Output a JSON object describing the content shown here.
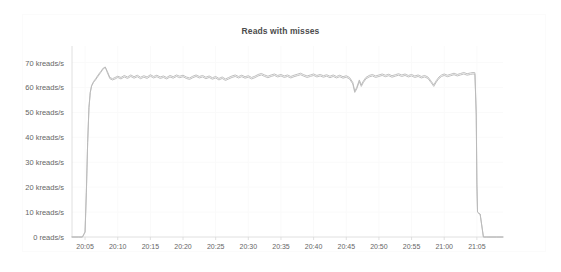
{
  "chart_data": {
    "type": "line",
    "title": "Reads with misses",
    "xlabel": "",
    "ylabel": "",
    "grid": true,
    "legend_position": "none",
    "ylim": [
      0,
      75
    ],
    "xlim": [
      "20:03",
      "21:09"
    ],
    "ytick_labels": [
      "70 kreads/s",
      "60 kreads/s",
      "50 kreads/s",
      "40 kreads/s",
      "30 kreads/s",
      "20 kreads/s",
      "10 kreads/s",
      "0 reads/s"
    ],
    "ytick_values": [
      70,
      60,
      50,
      40,
      30,
      20,
      10,
      0
    ],
    "xtick_labels": [
      "20:05",
      "20:10",
      "20:15",
      "20:20",
      "20:25",
      "20:30",
      "20:35",
      "20:40",
      "20:45",
      "20:50",
      "20:55",
      "21:00",
      "21:05"
    ],
    "xtick_minutes": [
      5,
      10,
      15,
      20,
      25,
      30,
      35,
      40,
      45,
      50,
      55,
      60,
      65
    ],
    "units": "kreads/s",
    "line_color": "#b9b9b9",
    "grid_color": "#fafafa",
    "axis_color": "#d8d8d8",
    "background_color": "#ffffff",
    "x_minutes": [
      3,
      4,
      4.6,
      5,
      5.2,
      5.4,
      5.6,
      5.8,
      6,
      6.3,
      6.6,
      7,
      7.4,
      7.8,
      8.1,
      8.4,
      8.8,
      9.2,
      9.6,
      10,
      10.5,
      11,
      11.5,
      12,
      12.5,
      13,
      13.5,
      14,
      14.5,
      15,
      15.5,
      16,
      16.5,
      17,
      17.5,
      18,
      18.5,
      19,
      19.5,
      20,
      20.5,
      21,
      21.5,
      22,
      22.5,
      23,
      23.5,
      24,
      24.5,
      25,
      25.5,
      26,
      26.5,
      27,
      27.5,
      28,
      28.5,
      29,
      29.5,
      30,
      30.5,
      31,
      31.5,
      32,
      32.5,
      33,
      33.5,
      34,
      34.5,
      35,
      35.5,
      36,
      36.5,
      37,
      37.5,
      38,
      38.5,
      39,
      39.5,
      40,
      40.5,
      41,
      41.5,
      42,
      42.5,
      43,
      43.5,
      44,
      44.5,
      45,
      45.5,
      46,
      46.3,
      46.6,
      47,
      47.3,
      47.6,
      48,
      48.5,
      49,
      49.5,
      50,
      50.5,
      51,
      51.5,
      52,
      52.5,
      53,
      53.5,
      54,
      54.5,
      55,
      55.5,
      56,
      56.5,
      57,
      57.5,
      58,
      58.4,
      58.8,
      59.2,
      59.6,
      60,
      60.5,
      61,
      61.5,
      62,
      62.5,
      63,
      63.5,
      64,
      64.4,
      64.7,
      64.9,
      65,
      65.1,
      65.3,
      65.5,
      66,
      66.5,
      67,
      68,
      69
    ],
    "series": [
      {
        "name": "reads-trace-a",
        "values": [
          0,
          0,
          0,
          2,
          18,
          38,
          52,
          58,
          60.5,
          62,
          63,
          64.5,
          66,
          67.5,
          68,
          66.5,
          64,
          63.5,
          64,
          64.5,
          64,
          64.8,
          64.2,
          65,
          64.3,
          64.9,
          64.1,
          64.7,
          64.2,
          65.1,
          64.4,
          64.9,
          64.2,
          64.6,
          64,
          64.8,
          64.3,
          65,
          64.5,
          64.9,
          64.2,
          63.8,
          64.5,
          65,
          64.4,
          64.8,
          64.1,
          64.6,
          63.9,
          64.4,
          63.6,
          64.2,
          63.4,
          64,
          64.6,
          65,
          64.4,
          64.9,
          64.3,
          64.7,
          64,
          64.5,
          65.2,
          65.6,
          65,
          64.5,
          65,
          65.4,
          64.8,
          65.2,
          64.6,
          65,
          64.4,
          64.9,
          65.3,
          65.7,
          65.1,
          64.6,
          65,
          65.4,
          64.8,
          65.2,
          64.7,
          65.1,
          64.5,
          65,
          64.4,
          64.9,
          64.3,
          64.7,
          64,
          62,
          58.5,
          60,
          63,
          61,
          62.5,
          64,
          64.8,
          65.2,
          64.6,
          65,
          65.4,
          64.9,
          65.3,
          64.7,
          65.1,
          65.5,
          65,
          65.4,
          64.8,
          65.2,
          64.6,
          65,
          64.4,
          64.8,
          64.2,
          62.5,
          61,
          62.8,
          64.2,
          65,
          65.4,
          64.9,
          65.3,
          65.7,
          65.2,
          65.6,
          66,
          65.5,
          65.8,
          66,
          65.9,
          50,
          22,
          10,
          9.5,
          9.2,
          0,
          0,
          0,
          0,
          0,
          0
        ]
      },
      {
        "name": "reads-trace-b",
        "values": [
          0,
          0,
          0,
          2,
          18,
          38,
          52,
          58,
          60.8,
          62.4,
          63.4,
          65,
          66.4,
          67.8,
          68.2,
          66,
          63.5,
          63,
          63.4,
          64,
          63.4,
          64.2,
          63.6,
          64.4,
          63.7,
          64.3,
          63.5,
          64.1,
          63.6,
          64.5,
          63.8,
          64.3,
          63.6,
          64,
          63.4,
          64.2,
          63.7,
          64.4,
          63.9,
          64.3,
          63.6,
          63.2,
          63.9,
          64.4,
          63.8,
          64.2,
          63.5,
          64,
          63.3,
          63.8,
          63,
          63.6,
          62.8,
          63.4,
          64,
          64.4,
          63.8,
          64.3,
          63.7,
          64.1,
          63.4,
          63.9,
          64.6,
          65,
          64.4,
          63.9,
          64.4,
          64.8,
          64.2,
          64.6,
          64,
          64.4,
          63.8,
          64.3,
          64.7,
          65.1,
          64.5,
          64,
          64.4,
          64.8,
          64.2,
          64.6,
          64.1,
          64.5,
          63.9,
          64.4,
          63.8,
          64.3,
          63.7,
          64.1,
          63.4,
          61.4,
          58,
          59.4,
          62.4,
          60.4,
          61.9,
          63.4,
          64.2,
          64.6,
          64,
          64.4,
          64.8,
          64.3,
          64.7,
          64.1,
          64.5,
          64.9,
          64.4,
          64.8,
          64.2,
          64.6,
          64,
          64.4,
          63.8,
          64.2,
          63.6,
          61.9,
          60.4,
          62.2,
          63.6,
          64.4,
          64.8,
          64.3,
          64.7,
          65.1,
          64.6,
          65,
          65.4,
          64.9,
          65.2,
          65.4,
          65.3,
          49,
          21,
          10,
          9.5,
          9.2,
          0,
          0,
          0,
          0,
          0,
          0
        ]
      }
    ]
  }
}
